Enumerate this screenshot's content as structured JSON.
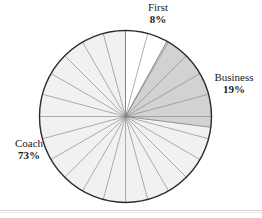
{
  "chart_data": {
    "type": "pie",
    "title": "",
    "subtitle": "",
    "xlabel": "",
    "ylabel": "",
    "legend_position": "none",
    "grid": false,
    "start_angle_deg": 0,
    "direction": "clockwise",
    "radial_spokes": 24,
    "spoke_step_deg": 15,
    "categories": [
      "First",
      "Business",
      "Coach"
    ],
    "values": [
      8,
      19,
      73
    ],
    "units": "percent",
    "slices": [
      {
        "name": "First",
        "value": 8,
        "label": "First",
        "value_label": "8%",
        "color": "#ffffff",
        "start_deg": 0,
        "end_deg": 28.8,
        "label_position": "top"
      },
      {
        "name": "Business",
        "value": 19,
        "label": "Business",
        "value_label": "19%",
        "color": "#d2d2d2",
        "start_deg": 28.8,
        "end_deg": 97.2,
        "label_position": "right"
      },
      {
        "name": "Coach",
        "value": 73,
        "label": "Coach",
        "value_label": "73%",
        "color": "#f1f1f1",
        "start_deg": 97.2,
        "end_deg": 360,
        "label_position": "left"
      }
    ],
    "geometry": {
      "center_x": 125.5,
      "center_y": 116.5,
      "radius": 86
    },
    "style": {
      "outline_color": "#2b2b2b",
      "spoke_color": "#8d8d8d",
      "background": "#ffffff",
      "rule_color": "#cfcfcf"
    }
  },
  "labels": {
    "first": {
      "name": "First",
      "pct": "8%"
    },
    "business": {
      "name": "Business",
      "pct": "19%"
    },
    "coach": {
      "name": "Coach",
      "pct": "73%"
    }
  }
}
